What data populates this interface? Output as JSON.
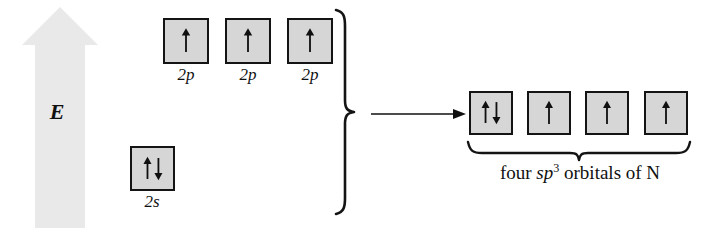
{
  "diagram": {
    "kind": "orbital-hybridization-energy-diagram",
    "energy_axis": {
      "label": "E",
      "direction": "up",
      "arrow_color": "#e9e9e9"
    },
    "box_fill_color": "#d6d6d6",
    "box_border_color": "#141414",
    "ink_color": "#101010",
    "left_side": {
      "p_orbitals": [
        {
          "label": "2p",
          "spins": "up"
        },
        {
          "label": "2p",
          "spins": "up"
        },
        {
          "label": "2p",
          "spins": "up"
        }
      ],
      "s_orbital": {
        "label": "2s",
        "spins": "up-down"
      }
    },
    "transition": {
      "arrow": "right-arrow",
      "brace": "right-curly-brace"
    },
    "right_side": {
      "hybrid_orbitals": [
        {
          "spins": "up-down"
        },
        {
          "spins": "up"
        },
        {
          "spins": "up"
        },
        {
          "spins": "up"
        }
      ],
      "caption": {
        "prefix": "four ",
        "italic": "sp",
        "superscript": "3",
        "suffix": " orbitals of N"
      }
    }
  }
}
